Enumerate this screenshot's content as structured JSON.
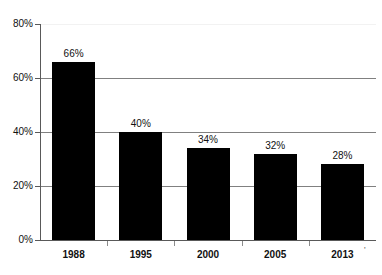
{
  "chart_data": {
    "type": "bar",
    "title": "",
    "subtitle": "",
    "xlabel": "",
    "ylabel": "",
    "categories": [
      "1988",
      "1995",
      "2000",
      "2005",
      "2013"
    ],
    "values": [
      66,
      40,
      34,
      32,
      28
    ],
    "data_labels": [
      "66%",
      "40%",
      "34%",
      "32%",
      "28%"
    ],
    "ylim": [
      0,
      80
    ],
    "ytick_values": [
      0,
      20,
      40,
      60,
      80
    ],
    "ytick_labels": [
      "0%",
      "20%",
      "40%",
      "60%",
      "80%"
    ],
    "grid": true,
    "legend": false,
    "legend_position": "none",
    "series": [
      {
        "name": "",
        "values": [
          66,
          40,
          34,
          32,
          28
        ],
        "color": "#000000"
      }
    ],
    "colors": {
      "bar": "#000000",
      "gridline": "#808080",
      "gridline_top": "#f2f2f2",
      "axis": "#595959",
      "text": "#111111",
      "background": "#ffffff"
    }
  },
  "annotations": {
    "stray_mark": "'"
  }
}
